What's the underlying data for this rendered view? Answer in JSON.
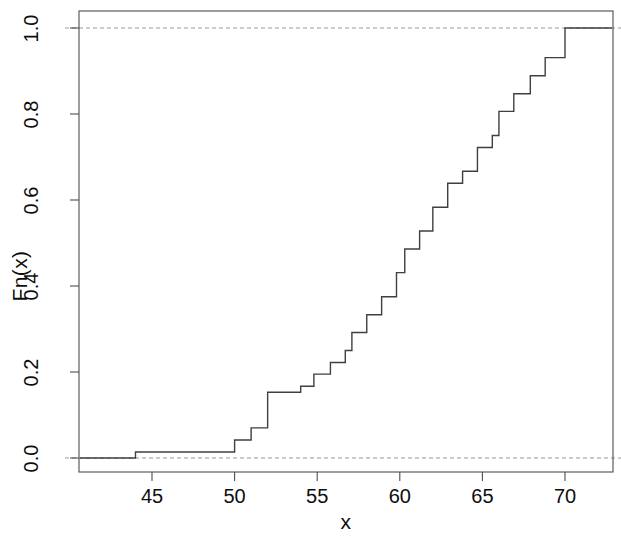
{
  "chart_data": {
    "type": "line",
    "subtype": "ecdf-step",
    "title": "",
    "xlabel": "x",
    "ylabel": "Fn(x)",
    "xlim": [
      41.5,
      73.5
    ],
    "ylim": [
      -0.04,
      1.04
    ],
    "xticks": [
      45,
      50,
      55,
      60,
      65,
      70
    ],
    "xtick_labels": [
      "45",
      "50",
      "55",
      "60",
      "65",
      "70"
    ],
    "yticks": [
      0.0,
      0.2,
      0.4,
      0.6,
      0.8,
      1.0
    ],
    "ytick_labels": [
      "0.0",
      "0.2",
      "0.4",
      "0.6",
      "0.8",
      "1.0"
    ],
    "grid": false,
    "legend": null,
    "reference_lines": [
      {
        "name": "zero-line",
        "y": 0.0,
        "style": "dashed",
        "color": "#999999"
      },
      {
        "name": "one-line",
        "y": 1.0,
        "style": "dashed",
        "color": "#999999"
      }
    ],
    "line_color": "#3f3f3f",
    "line_width": 1.4,
    "step_points_x": [
      44.0,
      50.0,
      51.0,
      52.0,
      54.0,
      54.8,
      55.8,
      56.7,
      57.1,
      58.0,
      58.9,
      59.8,
      60.3,
      61.2,
      62.0,
      62.9,
      63.8,
      64.7,
      65.6,
      66.0,
      66.9,
      67.9,
      68.8,
      70.0
    ],
    "step_points_y": [
      0.014,
      0.042,
      0.07,
      0.153,
      0.167,
      0.195,
      0.222,
      0.25,
      0.292,
      0.333,
      0.375,
      0.431,
      0.486,
      0.528,
      0.583,
      0.639,
      0.667,
      0.722,
      0.75,
      0.806,
      0.847,
      0.889,
      0.931,
      1.0
    ],
    "n_observations": 72,
    "left_plateau_value": 0.0,
    "right_plateau_value": 1.0
  },
  "axes": {
    "ylabel": "Fn(x)",
    "xlabel": "x"
  }
}
